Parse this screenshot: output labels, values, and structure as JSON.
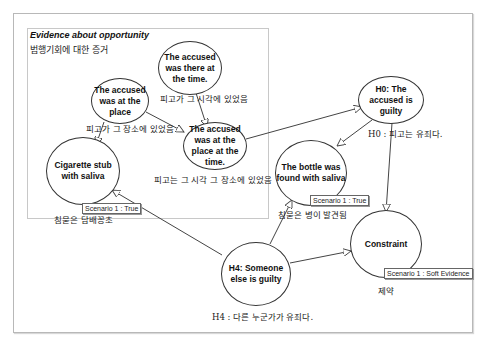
{
  "group": {
    "title": "Evidence about opportunity",
    "subtitle": "범행기회에 대한 증거"
  },
  "nodes": {
    "there_at_time": {
      "label": "The accused was there at the time.",
      "caption": "피고가 그 시각에 있었음"
    },
    "at_place": {
      "label": "The accused was at the place",
      "caption": "피고가 그 장소에 있었음"
    },
    "place_and_time": {
      "label": "The accused was at the place at the time.",
      "caption": "피고는 그 시각 그 장소에 있었음"
    },
    "cigarette": {
      "label": "Cigarette stub with saliva",
      "caption": "침묻은 담배꽁초",
      "badge": "Scenario 1 : True"
    },
    "h0": {
      "label": "H0: The accused is guilty",
      "caption": "H0 : 피고는 유죄다."
    },
    "bottle": {
      "label": "The bottle was found with saliva",
      "caption": "침묻은 병이 발견됨",
      "badge": "Scenario 1 : True"
    },
    "constraint": {
      "label": "Constraint",
      "caption": "제약",
      "badge": "Scenario 1 : Soft Evidence"
    },
    "h4": {
      "label": "H4: Someone else is guilty",
      "caption": "H4 : 다른 누군가가 유죄다."
    }
  },
  "colors": {
    "edge": "#444444",
    "frame": "#b8b8b8",
    "node_border": "#333333"
  }
}
